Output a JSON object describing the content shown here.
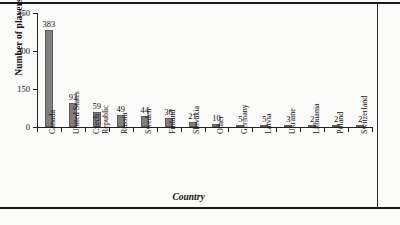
{
  "chart_data": {
    "type": "bar",
    "title": "",
    "xlabel": "Country",
    "ylabel": "Number of players",
    "categories": [
      "Canada",
      "United States",
      "Czech Republic",
      "Russia",
      "Sweden",
      "Finland",
      "Slovakia",
      "Other",
      "Germany",
      "Latvia",
      "Ukraine",
      "Lithuania",
      "Poland",
      "Switzerland"
    ],
    "values": [
      383,
      93,
      59,
      49,
      44,
      36,
      21,
      10,
      5,
      5,
      3,
      2,
      2,
      2
    ],
    "ylim": [
      0,
      450
    ],
    "yticks": [
      0,
      150,
      300,
      450
    ],
    "ytick_labels": [
      "0",
      "150",
      "300",
      "450"
    ],
    "grid": false,
    "legend": null,
    "bar_color": "#808080",
    "bar_edge_color": "#5a5a5a",
    "axis_color": "#222222",
    "text_color": "#111111",
    "background": "#fbfbf9"
  }
}
